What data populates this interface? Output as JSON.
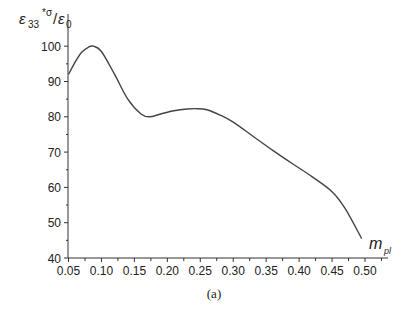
{
  "chart_data": {
    "type": "line",
    "title": "",
    "caption": "(a)",
    "xlabel": "m_pl",
    "xlabel_main": "m",
    "xlabel_sub": "pl",
    "ylabel": "ε33*σ/ε0",
    "ylabel_parts": {
      "eps": "ε",
      "sub": "33",
      "sup": "*σ",
      "slash": "/",
      "eps0": "ε",
      "sub0": "0"
    },
    "xlim": [
      0.05,
      0.52
    ],
    "ylim": [
      40,
      105
    ],
    "xticks": [
      "0.05",
      "0.10",
      "0.15",
      "0.20",
      "0.25",
      "0.30",
      "0.35",
      "0.40",
      "0.45",
      "0.50"
    ],
    "yticks": [
      "40",
      "50",
      "60",
      "70",
      "80",
      "90",
      "100"
    ],
    "grid": false,
    "legend": null,
    "series": [
      {
        "name": "ε33*σ/ε0",
        "x": [
          0.05,
          0.06,
          0.07,
          0.08,
          0.088,
          0.1,
          0.12,
          0.14,
          0.16,
          0.173,
          0.19,
          0.21,
          0.23,
          0.245,
          0.26,
          0.28,
          0.3,
          0.33,
          0.36,
          0.39,
          0.42,
          0.45,
          0.47,
          0.495
        ],
        "y": [
          92,
          95.5,
          98.3,
          99.7,
          100,
          98.5,
          92,
          85,
          80.8,
          80,
          80.8,
          81.7,
          82.2,
          82.3,
          82,
          80.5,
          78.5,
          74.5,
          70.5,
          66.7,
          63,
          58.8,
          54,
          45.5
        ]
      }
    ]
  }
}
